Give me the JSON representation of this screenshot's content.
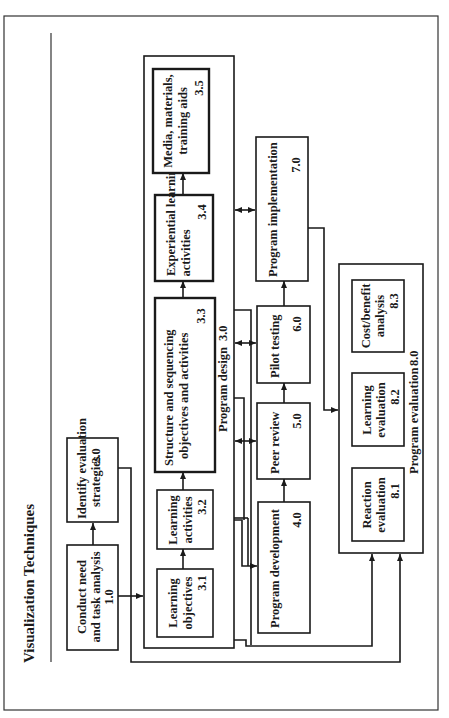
{
  "page": {
    "title": "Visualization Techniques",
    "orientation": "rotated-90-ccw"
  },
  "diagram": {
    "nodes": {
      "n1_0": {
        "lines": [
          "Conduct need",
          "and task analysis"
        ],
        "number": "1.0"
      },
      "n2_0": {
        "lines": [
          "Identify evaluation",
          "strategies"
        ],
        "number": "2.0"
      },
      "n3_0": {
        "label": "Program design",
        "number": "3.0"
      },
      "n3_1": {
        "lines": [
          "Learning",
          "objectives"
        ],
        "number": "3.1"
      },
      "n3_2": {
        "lines": [
          "Learning",
          "activities"
        ],
        "number": "3.2"
      },
      "n3_3": {
        "lines": [
          "Structure and sequencing",
          "objectives and activities"
        ],
        "number": "3.3"
      },
      "n3_4": {
        "lines": [
          "Experiential learning",
          "activities"
        ],
        "number": "3.4"
      },
      "n3_5": {
        "lines": [
          "Media, materials,",
          "training aids"
        ],
        "number": "3.5"
      },
      "n4_0": {
        "lines": [
          "Program development"
        ],
        "number": "4.0"
      },
      "n5_0": {
        "lines": [
          "Peer review"
        ],
        "number": "5.0"
      },
      "n6_0": {
        "lines": [
          "Pilot testing"
        ],
        "number": "6.0"
      },
      "n7_0": {
        "lines": [
          "Program implementation"
        ],
        "number": "7.0"
      },
      "n8_0": {
        "label": "Program evaluation",
        "number": "8.0"
      },
      "n8_1": {
        "lines": [
          "Reaction",
          "evaluation"
        ],
        "number": "8.1"
      },
      "n8_2": {
        "lines": [
          "Learning",
          "evaluation"
        ],
        "number": "8.2"
      },
      "n8_3": {
        "lines": [
          "Cost/benefit",
          "analysis"
        ],
        "number": "8.3"
      }
    },
    "edges": [
      [
        "1.0",
        "2.0"
      ],
      [
        "1.0",
        "3.0"
      ],
      [
        "2.0",
        "8.0"
      ],
      [
        "3.1",
        "3.2"
      ],
      [
        "3.2",
        "3.3"
      ],
      [
        "3.3",
        "3.4"
      ],
      [
        "3.4",
        "3.5"
      ],
      [
        "3.0",
        "4.0"
      ],
      [
        "3.0",
        "5.0",
        "bidirectional"
      ],
      [
        "3.0",
        "6.0",
        "bidirectional"
      ],
      [
        "3.0",
        "7.0",
        "bidirectional"
      ],
      [
        "4.0",
        "5.0"
      ],
      [
        "5.0",
        "6.0"
      ],
      [
        "6.0",
        "7.0"
      ],
      [
        "7.0",
        "8.0"
      ],
      [
        "3.0",
        "8.0"
      ]
    ]
  }
}
